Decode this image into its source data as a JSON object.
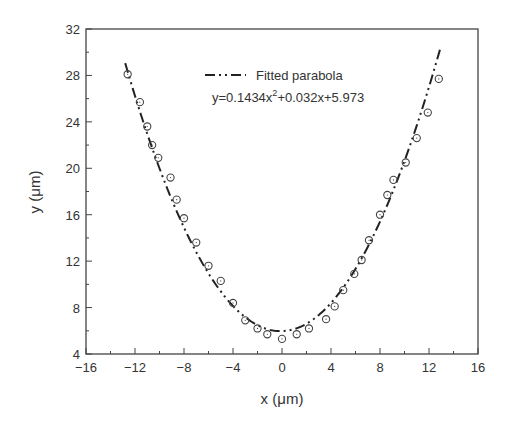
{
  "chart_data": {
    "type": "scatter",
    "title": "",
    "xlabel": "x (μm)",
    "ylabel": "y (μm)",
    "xlim": [
      -16,
      16
    ],
    "ylim": [
      4,
      32
    ],
    "xticks": [
      -16,
      -12,
      -8,
      -4,
      0,
      4,
      8,
      12,
      16
    ],
    "xtick_labels": [
      "−16",
      "−12",
      "−8",
      "−4",
      "0",
      "4",
      "8",
      "12",
      "16"
    ],
    "yticks": [
      4,
      8,
      12,
      16,
      20,
      24,
      28,
      32
    ],
    "ytick_labels": [
      "4",
      "8",
      "12",
      "16",
      "20",
      "24",
      "28",
      "32"
    ],
    "grid": false,
    "legend": {
      "position": "upper center",
      "entries": [
        {
          "label": "Fitted parabola",
          "style": "dash-dot-dot"
        }
      ],
      "equation": "y=0.1434x²+0.032x+5.973",
      "equation_base": "y=0.1434x",
      "equation_sup": "2",
      "equation_rest": "+0.032x+5.973"
    },
    "series": [
      {
        "name": "Measured",
        "marker": "open-circle",
        "x": [
          -12.6,
          -11.6,
          -11.0,
          -10.6,
          -10.1,
          -9.1,
          -8.6,
          -8.0,
          -7.0,
          -6.0,
          -5.0,
          -4.0,
          -3.0,
          -2.0,
          -1.2,
          0.0,
          1.2,
          2.2,
          3.6,
          4.3,
          5.0,
          5.9,
          6.5,
          7.1,
          8.0,
          8.6,
          9.1,
          10.1,
          11.0,
          11.9,
          12.8
        ],
        "y": [
          28.1,
          25.7,
          23.6,
          22.0,
          20.9,
          19.2,
          17.3,
          15.7,
          13.6,
          11.6,
          10.3,
          8.4,
          6.9,
          6.2,
          5.7,
          5.3,
          5.7,
          6.2,
          7.0,
          8.1,
          9.5,
          10.9,
          12.1,
          13.8,
          16.0,
          17.7,
          19.0,
          20.5,
          22.6,
          24.8,
          27.7
        ]
      },
      {
        "name": "Fitted parabola",
        "type": "line",
        "style": "dash-dot-dot",
        "coefficients": {
          "a": 0.1434,
          "b": 0.032,
          "c": 5.973
        },
        "x_range": [
          -12.8,
          12.9
        ]
      }
    ],
    "colors": {
      "axes": "#444444",
      "markers": "#444444",
      "fit_line": "#222222",
      "text": "#333333"
    }
  }
}
